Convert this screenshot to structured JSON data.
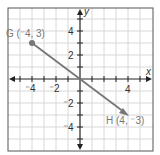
{
  "diagram": {
    "type": "coordinate-plane",
    "axes": {
      "x_label": "x",
      "y_label": "y"
    },
    "x_ticks": [
      "⁻4",
      "⁻2",
      "4"
    ],
    "y_ticks": [
      "4",
      "2",
      "⁻2",
      "⁻4"
    ],
    "range": {
      "x": [
        -6,
        6
      ],
      "y": [
        -6,
        6
      ]
    },
    "points": [
      {
        "name": "G",
        "label": "G (⁻4, 3)",
        "x": -4,
        "y": 3
      },
      {
        "name": "H",
        "label": "H (4, ⁻3)",
        "x": 4,
        "y": -3
      }
    ],
    "segment": {
      "from": "G",
      "to": "H",
      "arrow_at": "H",
      "color": "#777777"
    }
  }
}
